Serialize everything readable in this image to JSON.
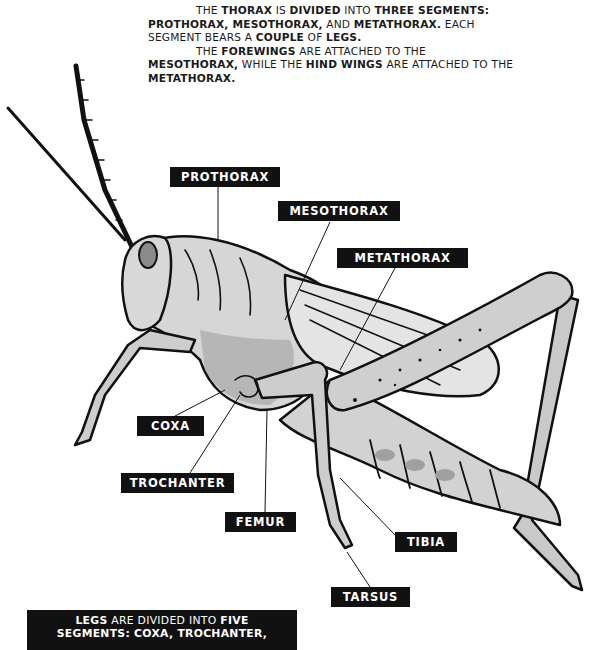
{
  "intro": {
    "paragraph1": {
      "segments": [
        {
          "text": "THE ",
          "bold": false
        },
        {
          "text": "THORAX",
          "bold": true
        },
        {
          "text": " IS ",
          "bold": false
        },
        {
          "text": "DIVIDED",
          "bold": true
        },
        {
          "text": " INTO ",
          "bold": false
        },
        {
          "text": "THREE SEGMENTS: PROTHORAX, MESOTHORAX,",
          "bold": true
        },
        {
          "text": " AND ",
          "bold": false
        },
        {
          "text": "METATHORAX.",
          "bold": true
        },
        {
          "text": " EACH SEGMENT BEARS A ",
          "bold": false
        },
        {
          "text": "COUPLE",
          "bold": true
        },
        {
          "text": " OF ",
          "bold": false
        },
        {
          "text": "LEGS.",
          "bold": true
        }
      ]
    },
    "paragraph2": {
      "segments": [
        {
          "text": "THE ",
          "bold": false
        },
        {
          "text": "FOREWINGS",
          "bold": true
        },
        {
          "text": " ARE ATTACHED TO THE ",
          "bold": false
        },
        {
          "text": "MESOTHORAX,",
          "bold": true
        },
        {
          "text": " WHILE THE ",
          "bold": false
        },
        {
          "text": "HIND WINGS",
          "bold": true
        },
        {
          "text": " ARE ATTACHED TO THE ",
          "bold": false
        },
        {
          "text": "METATHORAX.",
          "bold": true
        }
      ]
    }
  },
  "labels": {
    "prothorax": "PROTHORAX",
    "mesothorax": "MESOTHORAX",
    "metathorax": "METATHORAX",
    "coxa": "COXA",
    "trochanter": "TROCHANTER",
    "femur": "FEMUR",
    "tibia": "TIBIA",
    "tarsus": "TARSUS"
  },
  "bottom_note": {
    "segments": [
      {
        "text": "LEGS",
        "bold": true
      },
      {
        "text": " ARE DIVIDED INTO ",
        "bold": false
      },
      {
        "text": "FIVE",
        "bold": true
      },
      {
        "text": "\nSEGMENTS: COXA, TROCHANTER,",
        "bold": true
      }
    ]
  },
  "colors": {
    "label_bg": "#111111",
    "label_text": "#ffffff",
    "body_light": "#dcdcdc",
    "body_mid": "#b8b8b8",
    "body_dark": "#8c8c8c",
    "outline": "#111111"
  }
}
